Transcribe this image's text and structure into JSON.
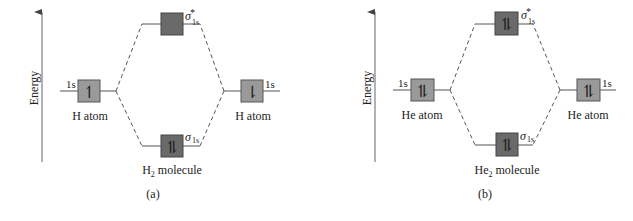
{
  "panels": [
    {
      "id": "a",
      "caption": "(a)",
      "axis_label": "Energy",
      "left_atom": {
        "label": "H atom",
        "orbital": "1s",
        "electrons": "↿"
      },
      "right_atom": {
        "label": "H atom",
        "orbital": "1s",
        "electrons": "⇂"
      },
      "antibonding": {
        "symbol": "σ",
        "sup": "*",
        "sub": "1s",
        "electrons": ""
      },
      "bonding": {
        "symbol": "σ",
        "sub": "1s",
        "electrons": "⥮"
      },
      "molecule": {
        "prefix": "H",
        "sub": "2",
        "suffix": " molecule"
      }
    },
    {
      "id": "b",
      "caption": "(b)",
      "axis_label": "Energy",
      "left_atom": {
        "label": "He atom",
        "orbital": "1s",
        "electrons": "⥮"
      },
      "right_atom": {
        "label": "He atom",
        "orbital": "1s",
        "electrons": "⥮"
      },
      "antibonding": {
        "symbol": "σ",
        "sup": "*",
        "sub": "1s",
        "electrons": "⥮"
      },
      "bonding": {
        "symbol": "σ",
        "sub": "1s",
        "electrons": "⥮"
      },
      "molecule": {
        "prefix": "He",
        "sub": "2",
        "suffix": " molecule"
      }
    }
  ],
  "colors": {
    "atomic_box": "#9a9a9a",
    "molecular_box": "#6a6a6a",
    "line": "#555555",
    "text": "#222222"
  }
}
